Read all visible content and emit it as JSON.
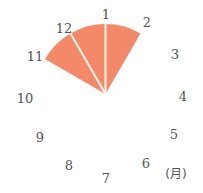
{
  "chart_data": {
    "type": "pie",
    "subtype": "clock-polar-sector",
    "title": "",
    "unit_label": "(月)",
    "categories": [
      "1",
      "2",
      "3",
      "4",
      "5",
      "6",
      "7",
      "8",
      "9",
      "10",
      "11",
      "12"
    ],
    "highlighted_period": {
      "start_month": 11,
      "end_month": 2,
      "segments": [
        {
          "from": 11,
          "to": 12
        },
        {
          "from": 12,
          "to": 1
        },
        {
          "from": 1,
          "to": 2
        }
      ]
    },
    "degrees_per_month": 30,
    "month_at_top": 1,
    "fill_color": "#F4896A",
    "divider_color": "#FFF6E8"
  },
  "labels": [
    {
      "text": "1",
      "x": 106,
      "y": 19
    },
    {
      "text": "2",
      "x": 147,
      "y": 27
    },
    {
      "text": "3",
      "x": 175,
      "y": 59
    },
    {
      "text": "4",
      "x": 183,
      "y": 101
    },
    {
      "text": "5",
      "x": 174,
      "y": 139
    },
    {
      "text": "6",
      "x": 146,
      "y": 168
    },
    {
      "text": "7",
      "x": 106,
      "y": 183
    },
    {
      "text": "8",
      "x": 69,
      "y": 170
    },
    {
      "text": "9",
      "x": 40,
      "y": 142
    },
    {
      "text": "10",
      "x": 25,
      "y": 103
    },
    {
      "text": "11",
      "x": 35,
      "y": 61
    },
    {
      "text": "12",
      "x": 64,
      "y": 33
    }
  ],
  "unit": {
    "text": "(月)",
    "x": 176,
    "y": 178
  }
}
